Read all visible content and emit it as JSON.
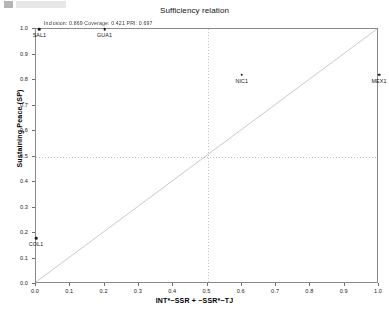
{
  "chart_data": {
    "type": "scatter",
    "title": "Sufficiency relation",
    "subtitle": "Inclusion: 0.869  Coverage: 0.421  PRI: 0.697",
    "xlabel": "INT*~SSR + ~SSR*~TJ",
    "ylabel": "Sustaining Peace (SP)",
    "xlim": [
      0,
      1
    ],
    "ylim": [
      0,
      1
    ],
    "grid": true,
    "gridlines": {
      "x": [
        0.5
      ],
      "y": [
        0.5
      ]
    },
    "legend": "none",
    "reference_line": {
      "type": "diagonal",
      "from": [
        0,
        0
      ],
      "to": [
        1,
        1
      ]
    },
    "xticks": [
      "0.0",
      "0.1",
      "0.2",
      "0.3",
      "0.4",
      "0.5",
      "0.6",
      "0.7",
      "0.8",
      "0.9",
      "1.0"
    ],
    "yticks": [
      "0.0",
      "0.1",
      "0.2",
      "0.3",
      "0.4",
      "0.5",
      "0.6",
      "0.7",
      "0.8",
      "0.9",
      "1.0"
    ],
    "points": [
      {
        "label": "SAL1",
        "x": 0.01,
        "y": 1.0
      },
      {
        "label": "GUA1",
        "x": 0.2,
        "y": 1.0
      },
      {
        "label": "NIC1",
        "x": 0.6,
        "y": 0.82
      },
      {
        "label": "MEX1",
        "x": 1.0,
        "y": 0.82
      },
      {
        "label": "COL1",
        "x": 0.0,
        "y": 0.18
      }
    ],
    "fit_measures": {
      "inclusion_label": "Inclusion:",
      "inclusion": "0.869",
      "coverage_label": "Coverage:",
      "coverage": "0.421",
      "pri_label": "PRI:",
      "pri": "0.697"
    },
    "colors": {
      "point": "#1b1b1b",
      "axis": "#8a8a8a",
      "grid": "#8c8c8c",
      "reference_line": "#c9c9c9"
    }
  }
}
